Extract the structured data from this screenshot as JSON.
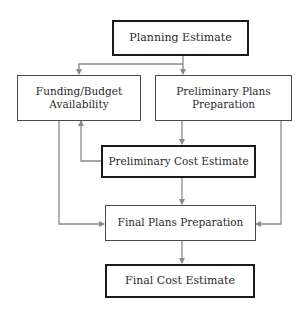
{
  "diagram": {
    "type": "flowchart",
    "nodes": {
      "planning_estimate": {
        "label": "Planning Estimate"
      },
      "funding_budget": {
        "line1": "Funding/Budget",
        "line2": "Availability"
      },
      "preliminary_plans": {
        "line1": "Preliminary Plans",
        "line2": "Preparation"
      },
      "preliminary_cost": {
        "label": "Preliminary Cost Estimate"
      },
      "final_plans": {
        "label": "Final Plans Preparation"
      },
      "final_cost": {
        "label": "Final Cost Estimate"
      }
    },
    "edges": [
      {
        "from": "Planning Estimate",
        "to": "Funding/Budget Availability"
      },
      {
        "from": "Planning Estimate",
        "to": "Preliminary Plans Preparation"
      },
      {
        "from": "Preliminary Plans Preparation",
        "to": "Preliminary Cost Estimate"
      },
      {
        "from": "Preliminary Cost Estimate",
        "to": "Funding/Budget Availability"
      },
      {
        "from": "Preliminary Cost Estimate",
        "to": "Final Plans Preparation"
      },
      {
        "from": "Funding/Budget Availability",
        "to": "Final Plans Preparation"
      },
      {
        "from": "Preliminary Plans Preparation",
        "to": "Final Plans Preparation"
      },
      {
        "from": "Final Plans Preparation",
        "to": "Final Cost Estimate"
      }
    ],
    "colors": {
      "connector": "#8a8a8a",
      "thin_border": "#4a4a4a",
      "thick_border": "#1a1a1a",
      "text": "#2a2a2a"
    }
  }
}
